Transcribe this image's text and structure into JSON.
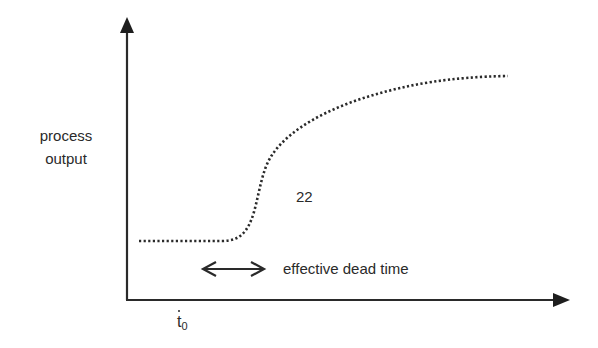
{
  "diagram": {
    "y_axis_label_line1": "process",
    "y_axis_label_line2": "output",
    "annotation_number": "22",
    "dead_time_label": "effective dead time",
    "x_tick_label": "t",
    "x_tick_subscript": "0",
    "colors": {
      "line": "#2a2a2a",
      "background": "#ffffff"
    }
  }
}
